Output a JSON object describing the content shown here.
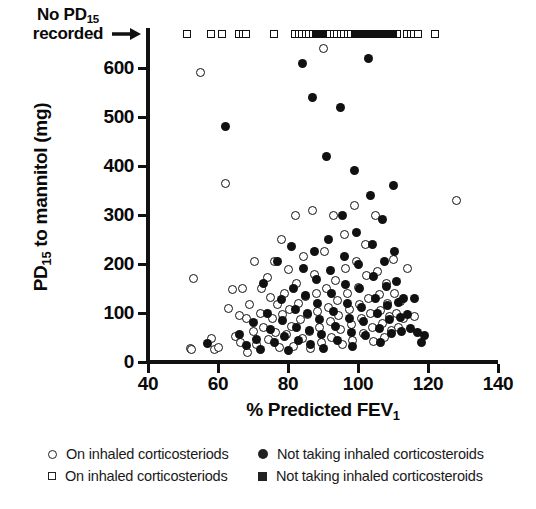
{
  "chart_data": {
    "type": "scatter",
    "title": "",
    "xlabel": "% Predicted FEV1",
    "ylabel": "PD15 to mannitol (mg)",
    "xlim": [
      40,
      140
    ],
    "ylim": [
      0,
      650
    ],
    "xticks": [
      40,
      60,
      80,
      100,
      120,
      140
    ],
    "yticks": [
      0,
      100,
      200,
      300,
      400,
      500,
      600
    ],
    "grid": false,
    "legend_position": "below-axis",
    "annotation": {
      "text_line1": "No PD15",
      "text_line2": "recorded",
      "icon": "right-arrow-icon",
      "description": "Row of square markers plotted above the y-axis maximum indicating subjects with no PD15 recorded"
    },
    "series": [
      {
        "name": "On inhaled corticosteriods",
        "marker": "open-circle",
        "color": "#ffffff",
        "edge_color": "#111111",
        "points": [
          [
            52,
            28
          ],
          [
            52.5,
            25
          ],
          [
            53,
            170
          ],
          [
            55,
            590
          ],
          [
            58,
            48
          ],
          [
            59,
            26
          ],
          [
            60,
            30
          ],
          [
            62,
            365
          ],
          [
            63,
            110
          ],
          [
            64,
            148
          ],
          [
            65,
            52
          ],
          [
            66,
            95
          ],
          [
            66.5,
            40
          ],
          [
            67,
            150
          ],
          [
            68,
            88
          ],
          [
            68.5,
            20
          ],
          [
            69,
            118
          ],
          [
            70,
            62
          ],
          [
            70.5,
            205
          ],
          [
            71,
            35
          ],
          [
            72,
            100
          ],
          [
            72.5,
            150
          ],
          [
            73,
            70
          ],
          [
            74,
            172
          ],
          [
            74.5,
            45
          ],
          [
            75,
            132
          ],
          [
            75.5,
            88
          ],
          [
            76,
            205
          ],
          [
            76.5,
            60
          ],
          [
            77,
            118
          ],
          [
            77.5,
            30
          ],
          [
            78,
            250
          ],
          [
            78.5,
            96
          ],
          [
            79,
            140
          ],
          [
            79.5,
            56
          ],
          [
            80,
            188
          ],
          [
            80.5,
            108
          ],
          [
            81,
            72
          ],
          [
            81.5,
            32
          ],
          [
            82,
            300
          ],
          [
            82.5,
            160
          ],
          [
            83,
            120
          ],
          [
            83.5,
            86
          ],
          [
            84,
            48
          ],
          [
            84.5,
            215
          ],
          [
            85,
            134
          ],
          [
            85.5,
            96
          ],
          [
            86,
            62
          ],
          [
            86.5,
            28
          ],
          [
            87,
            310
          ],
          [
            87.5,
            178
          ],
          [
            88,
            140
          ],
          [
            88.5,
            104
          ],
          [
            89,
            70
          ],
          [
            89.5,
            40
          ],
          [
            90,
            640
          ],
          [
            90.5,
            225
          ],
          [
            91,
            150
          ],
          [
            91.5,
            112
          ],
          [
            92,
            82
          ],
          [
            92.5,
            50
          ],
          [
            93,
            300
          ],
          [
            93.5,
            166
          ],
          [
            94,
            126
          ],
          [
            94.5,
            94
          ],
          [
            95,
            66
          ],
          [
            95.5,
            36
          ],
          [
            96,
            260
          ],
          [
            96.5,
            190
          ],
          [
            97,
            140
          ],
          [
            97.5,
            108
          ],
          [
            98,
            76
          ],
          [
            98.5,
            44
          ],
          [
            99,
            320
          ],
          [
            99.5,
            205
          ],
          [
            100,
            152
          ],
          [
            100.5,
            118
          ],
          [
            101,
            88
          ],
          [
            101.5,
            58
          ],
          [
            102,
            240
          ],
          [
            102.5,
            176
          ],
          [
            103,
            130
          ],
          [
            103.5,
            100
          ],
          [
            104,
            70
          ],
          [
            104.5,
            42
          ],
          [
            105,
            300
          ],
          [
            105.5,
            185
          ],
          [
            106,
            138
          ],
          [
            106.5,
            106
          ],
          [
            107,
            78
          ],
          [
            107.5,
            50
          ],
          [
            108,
            160
          ],
          [
            108.5,
            120
          ],
          [
            109,
            92
          ],
          [
            109.5,
            64
          ],
          [
            110,
            210
          ],
          [
            110.5,
            140
          ],
          [
            111,
            100
          ],
          [
            111.5,
            70
          ],
          [
            112,
            124
          ],
          [
            113,
            88
          ],
          [
            114,
            190
          ],
          [
            116,
            92
          ],
          [
            128,
            330
          ]
        ]
      },
      {
        "name": "Not taking inhaled corticosteroids",
        "marker": "filled-circle",
        "color": "#111111",
        "points": [
          [
            57,
            38
          ],
          [
            62,
            480
          ],
          [
            66,
            56
          ],
          [
            68,
            34
          ],
          [
            70,
            80
          ],
          [
            71,
            46
          ],
          [
            72,
            26
          ],
          [
            73,
            160
          ],
          [
            74,
            100
          ],
          [
            75,
            66
          ],
          [
            76,
            40
          ],
          [
            77,
            205
          ],
          [
            78,
            128
          ],
          [
            78.5,
            84
          ],
          [
            79,
            52
          ],
          [
            80,
            24
          ],
          [
            81,
            235
          ],
          [
            81.5,
            150
          ],
          [
            82,
            108
          ],
          [
            82.5,
            70
          ],
          [
            83,
            44
          ],
          [
            84,
            610
          ],
          [
            84.5,
            190
          ],
          [
            85,
            136
          ],
          [
            85.5,
            98
          ],
          [
            86,
            64
          ],
          [
            86.5,
            36
          ],
          [
            87,
            540
          ],
          [
            87.5,
            225
          ],
          [
            88,
            168
          ],
          [
            88.5,
            120
          ],
          [
            89,
            86
          ],
          [
            89.5,
            56
          ],
          [
            90,
            28
          ],
          [
            91,
            420
          ],
          [
            91.5,
            250
          ],
          [
            92,
            186
          ],
          [
            92.5,
            140
          ],
          [
            93,
            104
          ],
          [
            93.5,
            72
          ],
          [
            94,
            44
          ],
          [
            95,
            520
          ],
          [
            95.5,
            300
          ],
          [
            96,
            215
          ],
          [
            96.5,
            158
          ],
          [
            97,
            120
          ],
          [
            97.5,
            88
          ],
          [
            98,
            60
          ],
          [
            98.5,
            32
          ],
          [
            99,
            390
          ],
          [
            99.5,
            265
          ],
          [
            100,
            200
          ],
          [
            100.5,
            150
          ],
          [
            101,
            112
          ],
          [
            101.5,
            82
          ],
          [
            102,
            54
          ],
          [
            103,
            620
          ],
          [
            103.5,
            340
          ],
          [
            104,
            240
          ],
          [
            104.5,
            175
          ],
          [
            105,
            130
          ],
          [
            105.5,
            98
          ],
          [
            106,
            68
          ],
          [
            106.5,
            40
          ],
          [
            107,
            290
          ],
          [
            107.5,
            205
          ],
          [
            108,
            155
          ],
          [
            108.5,
            116
          ],
          [
            109,
            86
          ],
          [
            109.5,
            58
          ],
          [
            110,
            360
          ],
          [
            110.5,
            225
          ],
          [
            111,
            165
          ],
          [
            111.5,
            122
          ],
          [
            112,
            90
          ],
          [
            112.5,
            62
          ],
          [
            113,
            130
          ],
          [
            114,
            96
          ],
          [
            115,
            68
          ],
          [
            116,
            130
          ],
          [
            117,
            60
          ],
          [
            118,
            40
          ],
          [
            119,
            55
          ]
        ]
      },
      {
        "name": "On inhaled corticosteriods",
        "marker": "open-square",
        "color": "#ffffff",
        "edge_color": "#111111",
        "note": "plotted in the 'No PD15 recorded' row above the axis",
        "x_values": [
          51,
          58,
          61,
          66,
          67,
          68,
          76,
          82,
          83,
          84,
          85,
          86,
          87,
          88,
          89,
          90,
          91,
          92,
          93,
          94,
          95,
          96,
          97,
          98,
          99,
          100,
          101,
          102,
          103,
          104,
          105,
          106,
          107,
          108,
          109,
          110,
          111,
          114,
          115,
          116,
          117,
          122
        ]
      },
      {
        "name": "Not taking inhaled corticosteroids",
        "marker": "filled-square",
        "color": "#111111",
        "note": "plotted in the 'No PD15 recorded' row above the axis",
        "x_values": [
          88,
          89,
          90,
          99,
          100,
          101,
          102,
          103,
          104,
          105,
          107,
          109,
          110
        ]
      }
    ]
  },
  "axes": {
    "y_title_main": "PD",
    "y_title_sub": "15",
    "y_title_rest": " to mannitol (mg)",
    "x_title_main": "% Predicted FEV",
    "x_title_sub": "1"
  },
  "annotation": {
    "line1_main": "No PD",
    "line1_sub": "15",
    "line2": "recorded"
  },
  "legend": {
    "entries": [
      {
        "marker": "open-circle",
        "label": "On inhaled corticosteriods"
      },
      {
        "marker": "filled-circle",
        "label": "Not taking inhaled corticosteroids"
      },
      {
        "marker": "open-square",
        "label": "On inhaled corticosteriods"
      },
      {
        "marker": "filled-square",
        "label": "Not taking inhaled corticosteroids"
      }
    ]
  }
}
